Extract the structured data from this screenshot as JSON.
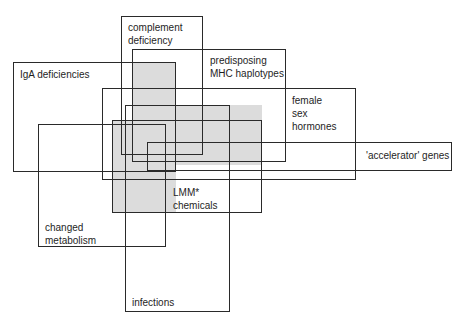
{
  "diagram": {
    "type": "overlapping-factor-boxes",
    "shade_color": "#dcdcdc",
    "line_color": "#2a2a2a",
    "factors": [
      {
        "id": "complement",
        "label": "complement\ndeficiency",
        "box": [
          121,
          16,
          82,
          139
        ],
        "label_pos": [
          128,
          21
        ]
      },
      {
        "id": "mhc",
        "label": "predisposing\nMHC haplotypes",
        "box": [
          132,
          49,
          154,
          113
        ],
        "label_pos": [
          210,
          54
        ]
      },
      {
        "id": "iga",
        "label": "IgA deficiencies",
        "box": [
          13,
          62,
          163,
          110
        ],
        "label_pos": [
          20,
          68
        ]
      },
      {
        "id": "female",
        "label": "female\nsex\nhormones",
        "box": [
          102,
          88,
          254,
          92
        ],
        "label_pos": [
          292,
          94
        ]
      },
      {
        "id": "accelerator",
        "label": "'accelerator' genes",
        "box": [
          147,
          142,
          305,
          29
        ],
        "label_pos": [
          366,
          149
        ]
      },
      {
        "id": "lmm",
        "label": "LMM*\nchemicals",
        "box": [
          112,
          120,
          150,
          93
        ],
        "label_pos": [
          173,
          186
        ]
      },
      {
        "id": "metabolism",
        "label": "changed\nmetabolism",
        "box": [
          38,
          124,
          128,
          123
        ],
        "label_pos": [
          45,
          221
        ]
      },
      {
        "id": "infections",
        "label": "infections",
        "box": [
          125,
          105,
          105,
          207
        ],
        "label_pos": [
          132,
          296
        ]
      }
    ],
    "shaded_regions": [
      [
        132,
        62,
        44,
        151
      ],
      [
        132,
        105,
        130,
        60
      ],
      [
        112,
        120,
        64,
        93
      ]
    ]
  }
}
